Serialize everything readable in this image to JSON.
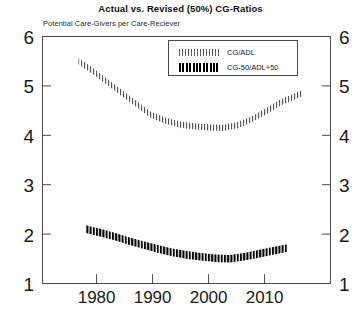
{
  "chart_data": {
    "type": "line",
    "title": "Actual vs. Revised (50%) CG-Ratios",
    "subtitle": "Potential Care-Givers per Care-Reciever",
    "xlabel": "",
    "ylabel": "",
    "xlim": [
      1975,
      2015
    ],
    "ylim": [
      1,
      6
    ],
    "xticks": [
      1980,
      1990,
      2000,
      2010
    ],
    "yticks": [
      1,
      2,
      3,
      4,
      5,
      6
    ],
    "grid": false,
    "legend_position": "top-center",
    "dual_y_axis": true,
    "series": [
      {
        "name": "CG/ADL",
        "marker": "hatched-band",
        "x": [
          1980,
          1982,
          1984,
          1986,
          1988,
          1990,
          1992,
          1994,
          1996,
          1998,
          2000,
          2002,
          2004,
          2006,
          2008,
          2011
        ],
        "values": [
          5.5,
          5.3,
          5.08,
          4.86,
          4.64,
          4.42,
          4.3,
          4.22,
          4.18,
          4.16,
          4.15,
          4.2,
          4.32,
          4.48,
          4.66,
          4.85
        ]
      },
      {
        "name": "CG-50/ADL+50",
        "marker": "solid-band",
        "x": [
          1981,
          1983,
          1985,
          1987,
          1989,
          1991,
          1993,
          1995,
          1997,
          1999,
          2001,
          2003,
          2005,
          2007,
          2009
        ],
        "values": [
          2.1,
          2.03,
          1.95,
          1.86,
          1.78,
          1.7,
          1.63,
          1.58,
          1.54,
          1.51,
          1.5,
          1.54,
          1.6,
          1.66,
          1.72
        ]
      }
    ]
  },
  "axis": {
    "left_ticks": [
      "6",
      "5",
      "4",
      "3",
      "2",
      "1"
    ],
    "right_ticks": [
      "6",
      "5",
      "4",
      "3",
      "2",
      "1"
    ],
    "x_ticks": [
      "1980",
      "1990",
      "2000",
      "2010"
    ]
  },
  "legend": {
    "entries": [
      {
        "label": "CG/ADL",
        "swatch": "hatched-band-swatch"
      },
      {
        "label": "CG-50/ADL+50",
        "swatch": "solid-band-swatch"
      }
    ]
  },
  "colors": {
    "series_1": "#2f2f2f",
    "series_2": "#000000",
    "frame": "#4a4a4a",
    "text": "#1a1a1a",
    "background": "#ffffff"
  }
}
